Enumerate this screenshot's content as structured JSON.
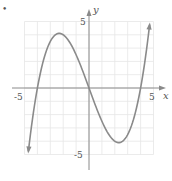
{
  "bullet": "•",
  "chart_data": {
    "type": "line",
    "title": "",
    "xlabel": "x",
    "ylabel": "y",
    "xlim": [
      -5,
      5
    ],
    "ylim": [
      -5,
      5
    ],
    "grid": true,
    "tick_labels": {
      "x": [
        "-5",
        "5"
      ],
      "y": [
        "5",
        "-5"
      ]
    },
    "function": "f(x) = x(x^2 - 16)/6",
    "zeros": [
      -4,
      0,
      4
    ],
    "local_max": {
      "x": -2.3,
      "y": 4.1
    },
    "local_min": {
      "x": 2.3,
      "y": -4.1
    },
    "endpoints_with_arrows": [
      {
        "x": -4.7,
        "y": -4.8
      },
      {
        "x": 4.7,
        "y": 4.8
      }
    ],
    "series": [
      {
        "name": "curve",
        "x": [
          -4.7,
          -4.5,
          -4,
          -3.5,
          -3,
          -2.5,
          -2.3,
          -2,
          -1.5,
          -1,
          -0.5,
          0,
          0.5,
          1,
          1.5,
          2,
          2.3,
          2.5,
          3,
          3.5,
          4,
          4.5,
          4.7
        ],
        "y": [
          -4.77,
          -3.19,
          0,
          3.02,
          3.5,
          4.06,
          4.1,
          4.0,
          3.16,
          2.5,
          1.31,
          0,
          -1.31,
          -2.5,
          -3.16,
          -4.0,
          -4.1,
          -4.06,
          -3.5,
          -3.02,
          0,
          3.19,
          4.77
        ]
      }
    ],
    "colors": {
      "curve": "#8a8a8a",
      "axes": "#8a8a8a",
      "grid": "#e6e6e6",
      "text": "#555555"
    }
  }
}
